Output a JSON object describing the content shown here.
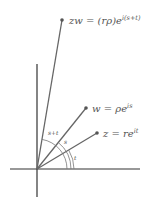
{
  "diagram": {
    "title": "",
    "points": [
      {
        "id": "zw",
        "label": "zw = (rρ)e",
        "sup": "i(s+t)",
        "x": 62,
        "y": 20
      },
      {
        "id": "w",
        "label": "w = ρe",
        "sup": "is",
        "x": 86,
        "y": 108
      },
      {
        "id": "z",
        "label": "z = re",
        "sup": "it",
        "x": 97,
        "y": 133
      }
    ],
    "angles": [
      {
        "id": "s_plus_t",
        "label": "s+t"
      },
      {
        "id": "s",
        "label": "s"
      },
      {
        "id": "t",
        "label": "t"
      }
    ],
    "origin": {
      "x": 37,
      "y": 169
    },
    "colors": {
      "axis": "#333333",
      "vector": "#666666",
      "label": "#555555"
    }
  }
}
